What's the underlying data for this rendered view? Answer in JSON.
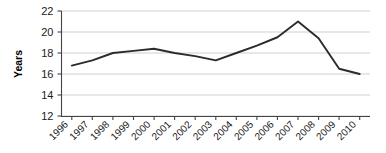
{
  "chart_data": {
    "type": "line",
    "title": "",
    "xlabel": "",
    "ylabel": "Years",
    "categories": [
      "1996",
      "1997",
      "1998",
      "1999",
      "2000",
      "2001",
      "2002",
      "2003",
      "2004",
      "2005",
      "2006",
      "2007",
      "2008",
      "2009",
      "2010"
    ],
    "values": [
      16.8,
      17.3,
      18.0,
      18.2,
      18.4,
      18.0,
      17.7,
      17.3,
      18.0,
      18.7,
      19.5,
      21.0,
      19.4,
      16.5,
      16.0
    ],
    "series": [
      {
        "name": "Years",
        "values": [
          16.8,
          17.3,
          18.0,
          18.2,
          18.4,
          18.0,
          17.7,
          17.3,
          18.0,
          18.7,
          19.5,
          21.0,
          19.4,
          16.5,
          16.0
        ]
      }
    ],
    "ylim": [
      12,
      22
    ],
    "ytick_labels": [
      "12",
      "14",
      "16",
      "18",
      "20",
      "22"
    ],
    "ytick_values": [
      12,
      14,
      16,
      18,
      20,
      22
    ],
    "grid": true,
    "grid_axis": "y",
    "legend": false,
    "legend_position": "none",
    "line_color": "#2b2b2b",
    "grid_color": "#c9c9c9",
    "axis_color": "#555555",
    "background_color": "#ffffff",
    "xtick_label_rotation": -45,
    "markers": false
  },
  "axis": {
    "y_title": "Years"
  }
}
